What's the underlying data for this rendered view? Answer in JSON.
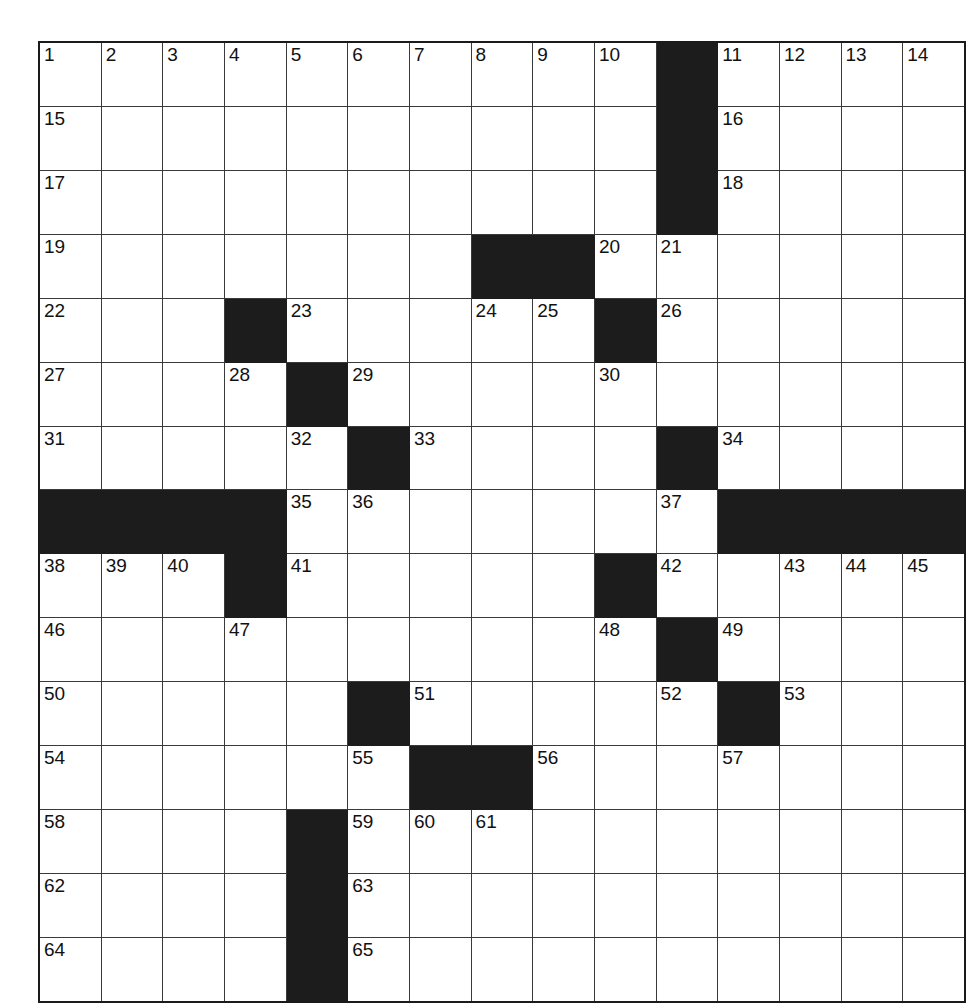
{
  "puzzle": {
    "kind": "crossword-grid",
    "rows": 15,
    "cols": 15,
    "colors": {
      "block": "#1c1c1c",
      "cell": "#ffffff",
      "grid_line": "#3a3a3a",
      "outer_border": "#1a1a1a",
      "number_text": "#111111",
      "page_background": "#ffffff"
    },
    "highest_clue_number": 65,
    "grid": [
      [
        {
          "block": false,
          "num": "1"
        },
        {
          "block": false,
          "num": "2"
        },
        {
          "block": false,
          "num": "3"
        },
        {
          "block": false,
          "num": "4"
        },
        {
          "block": false,
          "num": "5"
        },
        {
          "block": false,
          "num": "6"
        },
        {
          "block": false,
          "num": "7"
        },
        {
          "block": false,
          "num": "8"
        },
        {
          "block": false,
          "num": "9"
        },
        {
          "block": false,
          "num": "10"
        },
        {
          "block": true,
          "num": ""
        },
        {
          "block": false,
          "num": "11"
        },
        {
          "block": false,
          "num": "12"
        },
        {
          "block": false,
          "num": "13"
        },
        {
          "block": false,
          "num": "14"
        }
      ],
      [
        {
          "block": false,
          "num": "15"
        },
        {
          "block": false,
          "num": ""
        },
        {
          "block": false,
          "num": ""
        },
        {
          "block": false,
          "num": ""
        },
        {
          "block": false,
          "num": ""
        },
        {
          "block": false,
          "num": ""
        },
        {
          "block": false,
          "num": ""
        },
        {
          "block": false,
          "num": ""
        },
        {
          "block": false,
          "num": ""
        },
        {
          "block": false,
          "num": ""
        },
        {
          "block": true,
          "num": ""
        },
        {
          "block": false,
          "num": "16"
        },
        {
          "block": false,
          "num": ""
        },
        {
          "block": false,
          "num": ""
        },
        {
          "block": false,
          "num": ""
        }
      ],
      [
        {
          "block": false,
          "num": "17"
        },
        {
          "block": false,
          "num": ""
        },
        {
          "block": false,
          "num": ""
        },
        {
          "block": false,
          "num": ""
        },
        {
          "block": false,
          "num": ""
        },
        {
          "block": false,
          "num": ""
        },
        {
          "block": false,
          "num": ""
        },
        {
          "block": false,
          "num": ""
        },
        {
          "block": false,
          "num": ""
        },
        {
          "block": false,
          "num": ""
        },
        {
          "block": true,
          "num": ""
        },
        {
          "block": false,
          "num": "18"
        },
        {
          "block": false,
          "num": ""
        },
        {
          "block": false,
          "num": ""
        },
        {
          "block": false,
          "num": ""
        }
      ],
      [
        {
          "block": false,
          "num": "19"
        },
        {
          "block": false,
          "num": ""
        },
        {
          "block": false,
          "num": ""
        },
        {
          "block": false,
          "num": ""
        },
        {
          "block": false,
          "num": ""
        },
        {
          "block": false,
          "num": ""
        },
        {
          "block": false,
          "num": ""
        },
        {
          "block": true,
          "num": ""
        },
        {
          "block": true,
          "num": ""
        },
        {
          "block": false,
          "num": "20"
        },
        {
          "block": false,
          "num": "21"
        },
        {
          "block": false,
          "num": ""
        },
        {
          "block": false,
          "num": ""
        },
        {
          "block": false,
          "num": ""
        },
        {
          "block": false,
          "num": ""
        }
      ],
      [
        {
          "block": false,
          "num": "22"
        },
        {
          "block": false,
          "num": ""
        },
        {
          "block": false,
          "num": ""
        },
        {
          "block": true,
          "num": ""
        },
        {
          "block": false,
          "num": "23"
        },
        {
          "block": false,
          "num": ""
        },
        {
          "block": false,
          "num": ""
        },
        {
          "block": false,
          "num": "24"
        },
        {
          "block": false,
          "num": "25"
        },
        {
          "block": true,
          "num": ""
        },
        {
          "block": false,
          "num": "26"
        },
        {
          "block": false,
          "num": ""
        },
        {
          "block": false,
          "num": ""
        },
        {
          "block": false,
          "num": ""
        },
        {
          "block": false,
          "num": ""
        }
      ],
      [
        {
          "block": false,
          "num": "27"
        },
        {
          "block": false,
          "num": ""
        },
        {
          "block": false,
          "num": ""
        },
        {
          "block": false,
          "num": "28"
        },
        {
          "block": true,
          "num": ""
        },
        {
          "block": false,
          "num": "29"
        },
        {
          "block": false,
          "num": ""
        },
        {
          "block": false,
          "num": ""
        },
        {
          "block": false,
          "num": ""
        },
        {
          "block": false,
          "num": "30"
        },
        {
          "block": false,
          "num": ""
        },
        {
          "block": false,
          "num": ""
        },
        {
          "block": false,
          "num": ""
        },
        {
          "block": false,
          "num": ""
        },
        {
          "block": false,
          "num": ""
        }
      ],
      [
        {
          "block": false,
          "num": "31"
        },
        {
          "block": false,
          "num": ""
        },
        {
          "block": false,
          "num": ""
        },
        {
          "block": false,
          "num": ""
        },
        {
          "block": false,
          "num": "32"
        },
        {
          "block": true,
          "num": ""
        },
        {
          "block": false,
          "num": "33"
        },
        {
          "block": false,
          "num": ""
        },
        {
          "block": false,
          "num": ""
        },
        {
          "block": false,
          "num": ""
        },
        {
          "block": true,
          "num": ""
        },
        {
          "block": false,
          "num": "34"
        },
        {
          "block": false,
          "num": ""
        },
        {
          "block": false,
          "num": ""
        },
        {
          "block": false,
          "num": ""
        }
      ],
      [
        {
          "block": true,
          "num": ""
        },
        {
          "block": true,
          "num": ""
        },
        {
          "block": true,
          "num": ""
        },
        {
          "block": true,
          "num": ""
        },
        {
          "block": false,
          "num": "35"
        },
        {
          "block": false,
          "num": "36"
        },
        {
          "block": false,
          "num": ""
        },
        {
          "block": false,
          "num": ""
        },
        {
          "block": false,
          "num": ""
        },
        {
          "block": false,
          "num": ""
        },
        {
          "block": false,
          "num": "37"
        },
        {
          "block": true,
          "num": ""
        },
        {
          "block": true,
          "num": ""
        },
        {
          "block": true,
          "num": ""
        },
        {
          "block": true,
          "num": ""
        }
      ],
      [
        {
          "block": false,
          "num": "38"
        },
        {
          "block": false,
          "num": "39"
        },
        {
          "block": false,
          "num": "40"
        },
        {
          "block": true,
          "num": ""
        },
        {
          "block": false,
          "num": "41"
        },
        {
          "block": false,
          "num": ""
        },
        {
          "block": false,
          "num": ""
        },
        {
          "block": false,
          "num": ""
        },
        {
          "block": false,
          "num": ""
        },
        {
          "block": true,
          "num": ""
        },
        {
          "block": false,
          "num": "42"
        },
        {
          "block": false,
          "num": ""
        },
        {
          "block": false,
          "num": "43"
        },
        {
          "block": false,
          "num": "44"
        },
        {
          "block": false,
          "num": "45"
        }
      ],
      [
        {
          "block": false,
          "num": "46"
        },
        {
          "block": false,
          "num": ""
        },
        {
          "block": false,
          "num": ""
        },
        {
          "block": false,
          "num": "47"
        },
        {
          "block": false,
          "num": ""
        },
        {
          "block": false,
          "num": ""
        },
        {
          "block": false,
          "num": ""
        },
        {
          "block": false,
          "num": ""
        },
        {
          "block": false,
          "num": ""
        },
        {
          "block": false,
          "num": "48"
        },
        {
          "block": true,
          "num": ""
        },
        {
          "block": false,
          "num": "49"
        },
        {
          "block": false,
          "num": ""
        },
        {
          "block": false,
          "num": ""
        },
        {
          "block": false,
          "num": ""
        }
      ],
      [
        {
          "block": false,
          "num": "50"
        },
        {
          "block": false,
          "num": ""
        },
        {
          "block": false,
          "num": ""
        },
        {
          "block": false,
          "num": ""
        },
        {
          "block": false,
          "num": ""
        },
        {
          "block": true,
          "num": ""
        },
        {
          "block": false,
          "num": "51"
        },
        {
          "block": false,
          "num": ""
        },
        {
          "block": false,
          "num": ""
        },
        {
          "block": false,
          "num": ""
        },
        {
          "block": false,
          "num": "52"
        },
        {
          "block": true,
          "num": ""
        },
        {
          "block": false,
          "num": "53"
        },
        {
          "block": false,
          "num": ""
        },
        {
          "block": false,
          "num": ""
        }
      ],
      [
        {
          "block": false,
          "num": "54"
        },
        {
          "block": false,
          "num": ""
        },
        {
          "block": false,
          "num": ""
        },
        {
          "block": false,
          "num": ""
        },
        {
          "block": false,
          "num": ""
        },
        {
          "block": false,
          "num": "55"
        },
        {
          "block": true,
          "num": ""
        },
        {
          "block": true,
          "num": ""
        },
        {
          "block": false,
          "num": "56"
        },
        {
          "block": false,
          "num": ""
        },
        {
          "block": false,
          "num": ""
        },
        {
          "block": false,
          "num": "57"
        },
        {
          "block": false,
          "num": ""
        },
        {
          "block": false,
          "num": ""
        },
        {
          "block": false,
          "num": ""
        }
      ],
      [
        {
          "block": false,
          "num": "58"
        },
        {
          "block": false,
          "num": ""
        },
        {
          "block": false,
          "num": ""
        },
        {
          "block": false,
          "num": ""
        },
        {
          "block": true,
          "num": ""
        },
        {
          "block": false,
          "num": "59"
        },
        {
          "block": false,
          "num": "60"
        },
        {
          "block": false,
          "num": "61"
        },
        {
          "block": false,
          "num": ""
        },
        {
          "block": false,
          "num": ""
        },
        {
          "block": false,
          "num": ""
        },
        {
          "block": false,
          "num": ""
        },
        {
          "block": false,
          "num": ""
        },
        {
          "block": false,
          "num": ""
        },
        {
          "block": false,
          "num": ""
        }
      ],
      [
        {
          "block": false,
          "num": "62"
        },
        {
          "block": false,
          "num": ""
        },
        {
          "block": false,
          "num": ""
        },
        {
          "block": false,
          "num": ""
        },
        {
          "block": true,
          "num": ""
        },
        {
          "block": false,
          "num": "63"
        },
        {
          "block": false,
          "num": ""
        },
        {
          "block": false,
          "num": ""
        },
        {
          "block": false,
          "num": ""
        },
        {
          "block": false,
          "num": ""
        },
        {
          "block": false,
          "num": ""
        },
        {
          "block": false,
          "num": ""
        },
        {
          "block": false,
          "num": ""
        },
        {
          "block": false,
          "num": ""
        },
        {
          "block": false,
          "num": ""
        }
      ],
      [
        {
          "block": false,
          "num": "64"
        },
        {
          "block": false,
          "num": ""
        },
        {
          "block": false,
          "num": ""
        },
        {
          "block": false,
          "num": ""
        },
        {
          "block": true,
          "num": ""
        },
        {
          "block": false,
          "num": "65"
        },
        {
          "block": false,
          "num": ""
        },
        {
          "block": false,
          "num": ""
        },
        {
          "block": false,
          "num": ""
        },
        {
          "block": false,
          "num": ""
        },
        {
          "block": false,
          "num": ""
        },
        {
          "block": false,
          "num": ""
        },
        {
          "block": false,
          "num": ""
        },
        {
          "block": false,
          "num": ""
        },
        {
          "block": false,
          "num": ""
        }
      ]
    ]
  }
}
